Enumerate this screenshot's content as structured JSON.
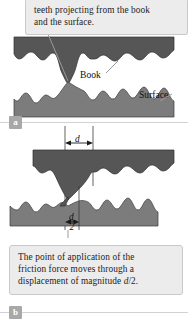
{
  "figure": {
    "panels": [
      {
        "key": "a",
        "badge": "a",
        "callout_lines": [
          "teeth projecting from the book",
          "and the surface."
        ],
        "labels": {
          "book": "Book",
          "surface": "Surface"
        },
        "colors": {
          "book_fill": "#565656",
          "surface_fill": "#7c7c7c",
          "callout_bg": "#ececec",
          "callout_border": "#c9c9c9",
          "badge_bg": "#a8a8a8",
          "leader": "#9a9a9a"
        }
      },
      {
        "key": "b",
        "badge": "b",
        "callout_lines_pre": [
          "The point of application of the",
          "friction force moves through a",
          "displacement of magnitude "
        ],
        "callout_math_tail": "d",
        "callout_tail_rest": "/2.",
        "dimensions": {
          "top_label": "d",
          "bottom_numerator": "d",
          "bottom_denominator": "2"
        }
      }
    ]
  }
}
